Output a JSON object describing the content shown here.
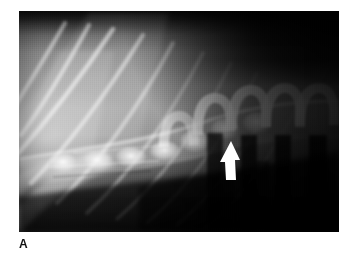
{
  "figure": {
    "panel_label": "A",
    "modality": "radiograph",
    "view": "lateral",
    "region": "thoracolumbar spine",
    "background_color": "#ffffff",
    "label_color": "#111111"
  },
  "image_area": {
    "left": 19,
    "top": 11,
    "width": 320,
    "height": 221,
    "border_color": "#000000"
  },
  "marker": {
    "type": "arrow",
    "name": "white-arrow-marker",
    "direction": "up",
    "color": "#ffffff",
    "x": 231,
    "y": 160,
    "tip_x": 231,
    "tip_y": 141,
    "tail_y": 180
  },
  "anatomy": {
    "ribs": [
      {
        "name": "rib-1",
        "x1": 4,
        "y1": 96,
        "x2": 44,
        "y2": 14,
        "opacity": 0.5
      },
      {
        "name": "rib-2",
        "x1": 10,
        "y1": 120,
        "x2": 66,
        "y2": 16,
        "opacity": 0.55
      },
      {
        "name": "rib-3",
        "x1": 2,
        "y1": 140,
        "x2": 92,
        "y2": 20,
        "opacity": 0.6
      },
      {
        "name": "rib-4",
        "x1": 18,
        "y1": 168,
        "x2": 120,
        "y2": 26,
        "opacity": 0.55
      },
      {
        "name": "rib-5",
        "x1": 44,
        "y1": 186,
        "x2": 150,
        "y2": 34,
        "opacity": 0.5
      },
      {
        "name": "rib-6",
        "x1": 74,
        "y1": 196,
        "x2": 180,
        "y2": 42,
        "opacity": 0.45
      },
      {
        "name": "rib-7",
        "x1": 104,
        "y1": 202,
        "x2": 208,
        "y2": 50,
        "opacity": 0.4
      },
      {
        "name": "rib-8",
        "x1": 134,
        "y1": 206,
        "x2": 234,
        "y2": 58,
        "opacity": 0.34
      },
      {
        "name": "rib-9",
        "x1": 164,
        "y1": 208,
        "x2": 258,
        "y2": 66,
        "opacity": 0.28
      }
    ],
    "vertebrae": [
      {
        "name": "vertebra-1",
        "x": 34,
        "width": 36,
        "top": 118
      },
      {
        "name": "vertebra-2",
        "x": 70,
        "width": 36,
        "top": 116
      },
      {
        "name": "vertebra-3",
        "x": 106,
        "width": 36,
        "top": 114
      },
      {
        "name": "vertebra-4",
        "x": 142,
        "width": 36,
        "top": 110
      },
      {
        "name": "vertebra-5",
        "x": 178,
        "width": 36,
        "top": 100
      },
      {
        "name": "vertebra-6",
        "x": 214,
        "width": 36,
        "top": 88
      },
      {
        "name": "vertebra-7",
        "x": 250,
        "width": 36,
        "top": 84
      },
      {
        "name": "vertebra-8",
        "x": 286,
        "width": 36,
        "top": 84
      }
    ],
    "spinous_processes": [
      {
        "name": "spinous-process-1",
        "x": 186,
        "width": 30,
        "top": 72,
        "height": 50
      },
      {
        "name": "spinous-process-2",
        "x": 220,
        "width": 30,
        "top": 66,
        "height": 54
      },
      {
        "name": "spinous-process-3",
        "x": 254,
        "width": 30,
        "top": 64,
        "height": 54
      },
      {
        "name": "spinous-process-4",
        "x": 288,
        "width": 30,
        "top": 64,
        "height": 54
      }
    ],
    "dark_intervertebral_bands": [
      {
        "name": "gas-band-1",
        "x": 190,
        "width": 16,
        "top": 118,
        "height": 96
      },
      {
        "name": "gas-band-2",
        "x": 224,
        "width": 16,
        "top": 120,
        "height": 96
      },
      {
        "name": "gas-band-3",
        "x": 258,
        "width": 16,
        "top": 120,
        "height": 96
      },
      {
        "name": "gas-band-4",
        "x": 292,
        "width": 18,
        "top": 120,
        "height": 96
      }
    ]
  }
}
